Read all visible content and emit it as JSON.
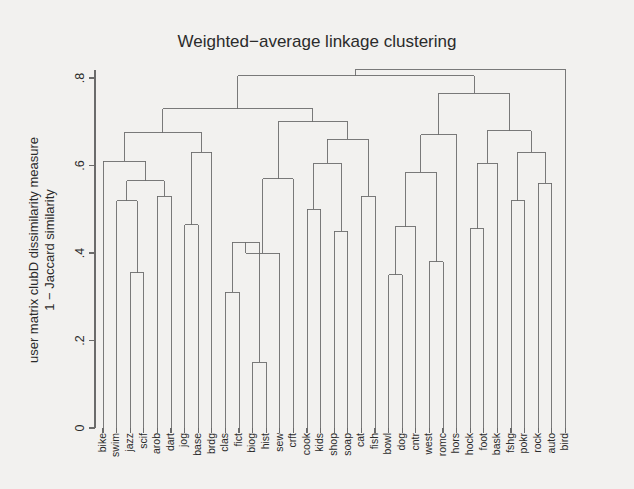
{
  "chart_data": {
    "type": "dendrogram",
    "title": "Weighted−average linkage clustering",
    "xlabel": "",
    "ylabel_line1": "user matrix clubD dissimilarity measure",
    "ylabel_line2": "1 − Jaccard similarity",
    "ylim": [
      0,
      0.86
    ],
    "yticks": [
      0,
      0.2,
      0.4,
      0.6,
      0.8
    ],
    "ytick_labels": [
      "0",
      ".2",
      ".4",
      ".6",
      ".8"
    ],
    "grid": false,
    "legend": "none",
    "leaf_order": [
      "bike",
      "swim",
      "jazz",
      "scif",
      "arob",
      "dart",
      "jog",
      "base",
      "brdg",
      "clas",
      "fict",
      "biog",
      "hist",
      "sew",
      "crft",
      "cook",
      "kids",
      "shop",
      "soap",
      "cat",
      "fish",
      "bowl",
      "dog",
      "cntr",
      "west",
      "romc",
      "hors",
      "hock",
      "foot",
      "bask",
      "fshg",
      "pokr",
      "rock",
      "auto",
      "bird"
    ],
    "merges": [
      {
        "id": "m1",
        "left": "jazz",
        "right": "scif",
        "height": 0.355
      },
      {
        "id": "m2",
        "left": "swim",
        "right": "m1",
        "height": 0.52
      },
      {
        "id": "m3",
        "left": "arob",
        "right": "dart",
        "height": 0.53
      },
      {
        "id": "m4",
        "left": "m2",
        "right": "m3",
        "height": 0.565
      },
      {
        "id": "m5",
        "left": "bike",
        "right": "m4",
        "height": 0.61
      },
      {
        "id": "m6",
        "left": "jog",
        "right": "base",
        "height": 0.465
      },
      {
        "id": "m7",
        "left": "m6",
        "right": "brdg",
        "height": 0.63
      },
      {
        "id": "m8",
        "left": "m5",
        "right": "m7",
        "height": 0.675
      },
      {
        "id": "m9",
        "left": "clas",
        "right": "fict",
        "height": 0.31
      },
      {
        "id": "m10",
        "left": "biog",
        "right": "hist",
        "height": 0.15
      },
      {
        "id": "m11",
        "left": "m9",
        "right": "m10",
        "height": 0.425
      },
      {
        "id": "m12",
        "left": "m11",
        "right": "sew",
        "height": 0.4
      },
      {
        "id": "m13",
        "left": "m12",
        "right": "crft",
        "height": 0.57
      },
      {
        "id": "m14",
        "left": "cook",
        "right": "kids",
        "height": 0.5
      },
      {
        "id": "m15",
        "left": "shop",
        "right": "soap",
        "height": 0.45
      },
      {
        "id": "m16",
        "left": "m14",
        "right": "m15",
        "height": 0.605
      },
      {
        "id": "m17",
        "left": "cat",
        "right": "fish",
        "height": 0.53
      },
      {
        "id": "m18",
        "left": "m16",
        "right": "m17",
        "height": 0.66
      },
      {
        "id": "m19",
        "left": "m13",
        "right": "m18",
        "height": 0.7
      },
      {
        "id": "m20",
        "left": "m8",
        "right": "m19",
        "height": 0.73
      },
      {
        "id": "m21",
        "left": "bowl",
        "right": "dog",
        "height": 0.35
      },
      {
        "id": "m22",
        "left": "m21",
        "right": "cntr",
        "height": 0.46
      },
      {
        "id": "m23",
        "left": "west",
        "right": "romc",
        "height": 0.38
      },
      {
        "id": "m24",
        "left": "m22",
        "right": "m23",
        "height": 0.585
      },
      {
        "id": "m25",
        "left": "m24",
        "right": "hors",
        "height": 0.67
      },
      {
        "id": "m26",
        "left": "hock",
        "right": "foot",
        "height": 0.455
      },
      {
        "id": "m27",
        "left": "m26",
        "right": "bask",
        "height": 0.605
      },
      {
        "id": "m28",
        "left": "fshg",
        "right": "pokr",
        "height": 0.52
      },
      {
        "id": "m29",
        "left": "rock",
        "right": "auto",
        "height": 0.56
      },
      {
        "id": "m30",
        "left": "m28",
        "right": "m29",
        "height": 0.63
      },
      {
        "id": "m31",
        "left": "m27",
        "right": "m30",
        "height": 0.68
      },
      {
        "id": "m32",
        "left": "m25",
        "right": "m31",
        "height": 0.765
      },
      {
        "id": "m33",
        "left": "m20",
        "right": "m32",
        "height": 0.805
      },
      {
        "id": "m34",
        "left": "m33",
        "right": "bird",
        "height": 0.82
      }
    ],
    "root": "m34",
    "colors": {
      "background": "#f2f1ef",
      "line": "#6b6b6b",
      "text": "#2b2b2b"
    }
  }
}
